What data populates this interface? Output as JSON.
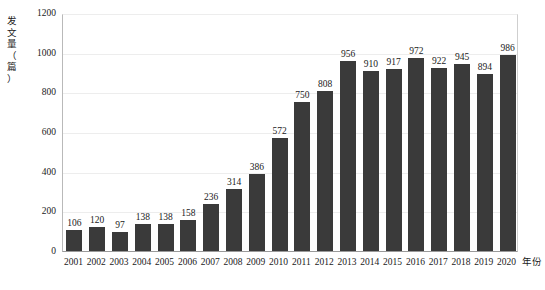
{
  "chart_data": {
    "type": "bar",
    "title": "",
    "subtitle": "",
    "xlabel": "年份",
    "ylabel": "发文量（篇）",
    "ylabel_chars": [
      "发",
      "文",
      "量",
      "（",
      "篇",
      "）"
    ],
    "categories": [
      "2001",
      "2002",
      "2003",
      "2004",
      "2005",
      "2006",
      "2007",
      "2008",
      "2009",
      "2010",
      "2011",
      "2012",
      "2013",
      "2014",
      "2015",
      "2016",
      "2017",
      "2018",
      "2019",
      "2020"
    ],
    "values": [
      106,
      120,
      97,
      138,
      138,
      158,
      236,
      314,
      386,
      572,
      750,
      808,
      956,
      910,
      917,
      972,
      922,
      945,
      894,
      986
    ],
    "ylim": [
      0,
      1200
    ],
    "yticks": [
      0,
      200,
      400,
      600,
      800,
      1000,
      1200
    ],
    "ytick_labels": [
      "0",
      "200",
      "400",
      "600",
      "800",
      "1000",
      "1200"
    ],
    "grid": true,
    "grid_axis": "y",
    "legend": false,
    "legend_position": "none",
    "data_labels": true,
    "bar_color": "#3a3a3a",
    "grid_color": "#ededed",
    "axis_color": "#9a9a9a",
    "background_color": "#ffffff",
    "text_color": "#1a1a1a"
  }
}
